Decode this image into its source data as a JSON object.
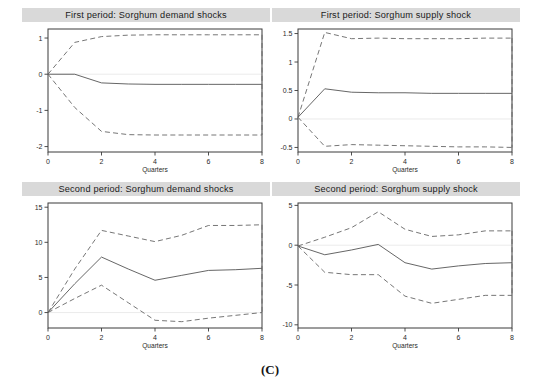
{
  "figure": {
    "caption": "(C)",
    "panel_count": 4,
    "background_color": "#ffffff",
    "title_bar_color": "#d9d9d9",
    "mean_line_color": "#555555",
    "band_line_color": "#666666"
  },
  "chart_data": [
    {
      "id": "first-period-demand",
      "type": "line",
      "title": "First period: Sorghum demand shocks",
      "xlabel": "Quarters",
      "ylabel": "",
      "x": [
        0,
        1,
        2,
        3,
        4,
        5,
        6,
        7,
        8
      ],
      "xlim": [
        0,
        8
      ],
      "ylim": [
        -2.15,
        1.25
      ],
      "xticks": [
        0,
        2,
        4,
        6,
        8
      ],
      "xtick_labels": [
        "0",
        "2",
        "4",
        "6",
        "8"
      ],
      "yticks": [
        1,
        0,
        -1,
        -2
      ],
      "ytick_labels": [
        "1",
        "0",
        "-1",
        "-2"
      ],
      "grid": false,
      "legend": "none",
      "series": [
        {
          "name": "upper 95% CI",
          "style": "dashed",
          "values": [
            0.0,
            0.88,
            1.04,
            1.08,
            1.09,
            1.09,
            1.09,
            1.09,
            1.09
          ]
        },
        {
          "name": "impulse response",
          "style": "solid",
          "values": [
            0.0,
            0.0,
            -0.24,
            -0.27,
            -0.28,
            -0.28,
            -0.28,
            -0.28,
            -0.28
          ]
        },
        {
          "name": "lower 95% CI",
          "style": "dashed",
          "values": [
            0.0,
            -0.92,
            -1.58,
            -1.67,
            -1.68,
            -1.68,
            -1.68,
            -1.68,
            -1.68
          ]
        }
      ]
    },
    {
      "id": "first-period-supply",
      "type": "line",
      "title": "First period: Sorghum supply shock",
      "xlabel": "Quarters",
      "ylabel": "",
      "x": [
        0,
        1,
        2,
        3,
        4,
        5,
        6,
        7,
        8
      ],
      "xlim": [
        0,
        8
      ],
      "ylim": [
        -0.58,
        1.58
      ],
      "xticks": [
        0,
        2,
        4,
        6,
        8
      ],
      "xtick_labels": [
        "0",
        "2",
        "4",
        "6",
        "8"
      ],
      "yticks": [
        1.5,
        1,
        0.5,
        0,
        -0.5
      ],
      "ytick_labels": [
        "1.5",
        "1",
        "0.5",
        "0",
        "-0.5"
      ],
      "grid": false,
      "legend": "none",
      "series": [
        {
          "name": "upper 95% CI",
          "style": "dashed",
          "values": [
            0.03,
            1.52,
            1.41,
            1.42,
            1.41,
            1.41,
            1.41,
            1.42,
            1.42
          ]
        },
        {
          "name": "impulse response",
          "style": "solid",
          "values": [
            0.03,
            0.53,
            0.47,
            0.46,
            0.46,
            0.45,
            0.45,
            0.45,
            0.45
          ]
        },
        {
          "name": "lower 95% CI",
          "style": "dashed",
          "values": [
            0.03,
            -0.48,
            -0.45,
            -0.46,
            -0.47,
            -0.48,
            -0.49,
            -0.49,
            -0.5
          ]
        }
      ]
    },
    {
      "id": "second-period-demand",
      "type": "line",
      "title": "Second period: Sorghum demand shocks",
      "xlabel": "Quarters",
      "ylabel": "",
      "x": [
        0,
        1,
        2,
        3,
        4,
        5,
        6,
        7,
        8
      ],
      "xlim": [
        0,
        8
      ],
      "ylim": [
        -2.2,
        15.6
      ],
      "xticks": [
        0,
        2,
        4,
        6,
        8
      ],
      "xtick_labels": [
        "0",
        "2",
        "4",
        "6",
        "8"
      ],
      "yticks": [
        15,
        10,
        5,
        0
      ],
      "ytick_labels": [
        "15",
        "10",
        "5",
        "0"
      ],
      "grid": false,
      "legend": "none",
      "series": [
        {
          "name": "upper 95% CI",
          "style": "dashed",
          "values": [
            0.0,
            6.2,
            11.7,
            10.9,
            10.1,
            11.0,
            12.4,
            12.4,
            12.5
          ]
        },
        {
          "name": "impulse response",
          "style": "solid",
          "values": [
            0.0,
            4.1,
            7.9,
            6.2,
            4.6,
            5.3,
            6.0,
            6.1,
            6.3
          ]
        },
        {
          "name": "lower 95% CI",
          "style": "dashed",
          "values": [
            0.0,
            2.0,
            3.9,
            1.4,
            -1.1,
            -1.3,
            -0.8,
            -0.4,
            0.0
          ]
        }
      ]
    },
    {
      "id": "second-period-supply",
      "type": "line",
      "title": "Second period: Sorghum supply shock",
      "xlabel": "Quarters",
      "ylabel": "",
      "x": [
        0,
        1,
        2,
        3,
        4,
        5,
        6,
        7,
        8
      ],
      "xlim": [
        0,
        8
      ],
      "ylim": [
        -10.4,
        5.3
      ],
      "xticks": [
        0,
        2,
        4,
        6,
        8
      ],
      "xtick_labels": [
        "0",
        "2",
        "4",
        "6",
        "8"
      ],
      "yticks": [
        5,
        0,
        -5,
        -10
      ],
      "ytick_labels": [
        "5",
        "0",
        "-5",
        "-10"
      ],
      "grid": false,
      "legend": "none",
      "series": [
        {
          "name": "upper 95% CI",
          "style": "dashed",
          "values": [
            -0.1,
            1.0,
            2.2,
            4.2,
            2.0,
            1.1,
            1.3,
            1.8,
            1.8
          ]
        },
        {
          "name": "impulse response",
          "style": "solid",
          "values": [
            -0.1,
            -1.2,
            -0.6,
            0.1,
            -2.2,
            -3.0,
            -2.6,
            -2.3,
            -2.2
          ]
        },
        {
          "name": "lower 95% CI",
          "style": "dashed",
          "values": [
            -0.1,
            -3.4,
            -3.7,
            -3.7,
            -6.4,
            -7.3,
            -6.8,
            -6.3,
            -6.3
          ]
        }
      ]
    }
  ],
  "panel_layout": [
    {
      "id": "first-period-demand",
      "left": 22,
      "top": 8,
      "width": 248,
      "height": 170
    },
    {
      "id": "first-period-supply",
      "left": 272,
      "top": 8,
      "width": 248,
      "height": 170
    },
    {
      "id": "second-period-demand",
      "left": 22,
      "top": 182,
      "width": 248,
      "height": 172
    },
    {
      "id": "second-period-supply",
      "left": 272,
      "top": 182,
      "width": 248,
      "height": 172
    }
  ]
}
